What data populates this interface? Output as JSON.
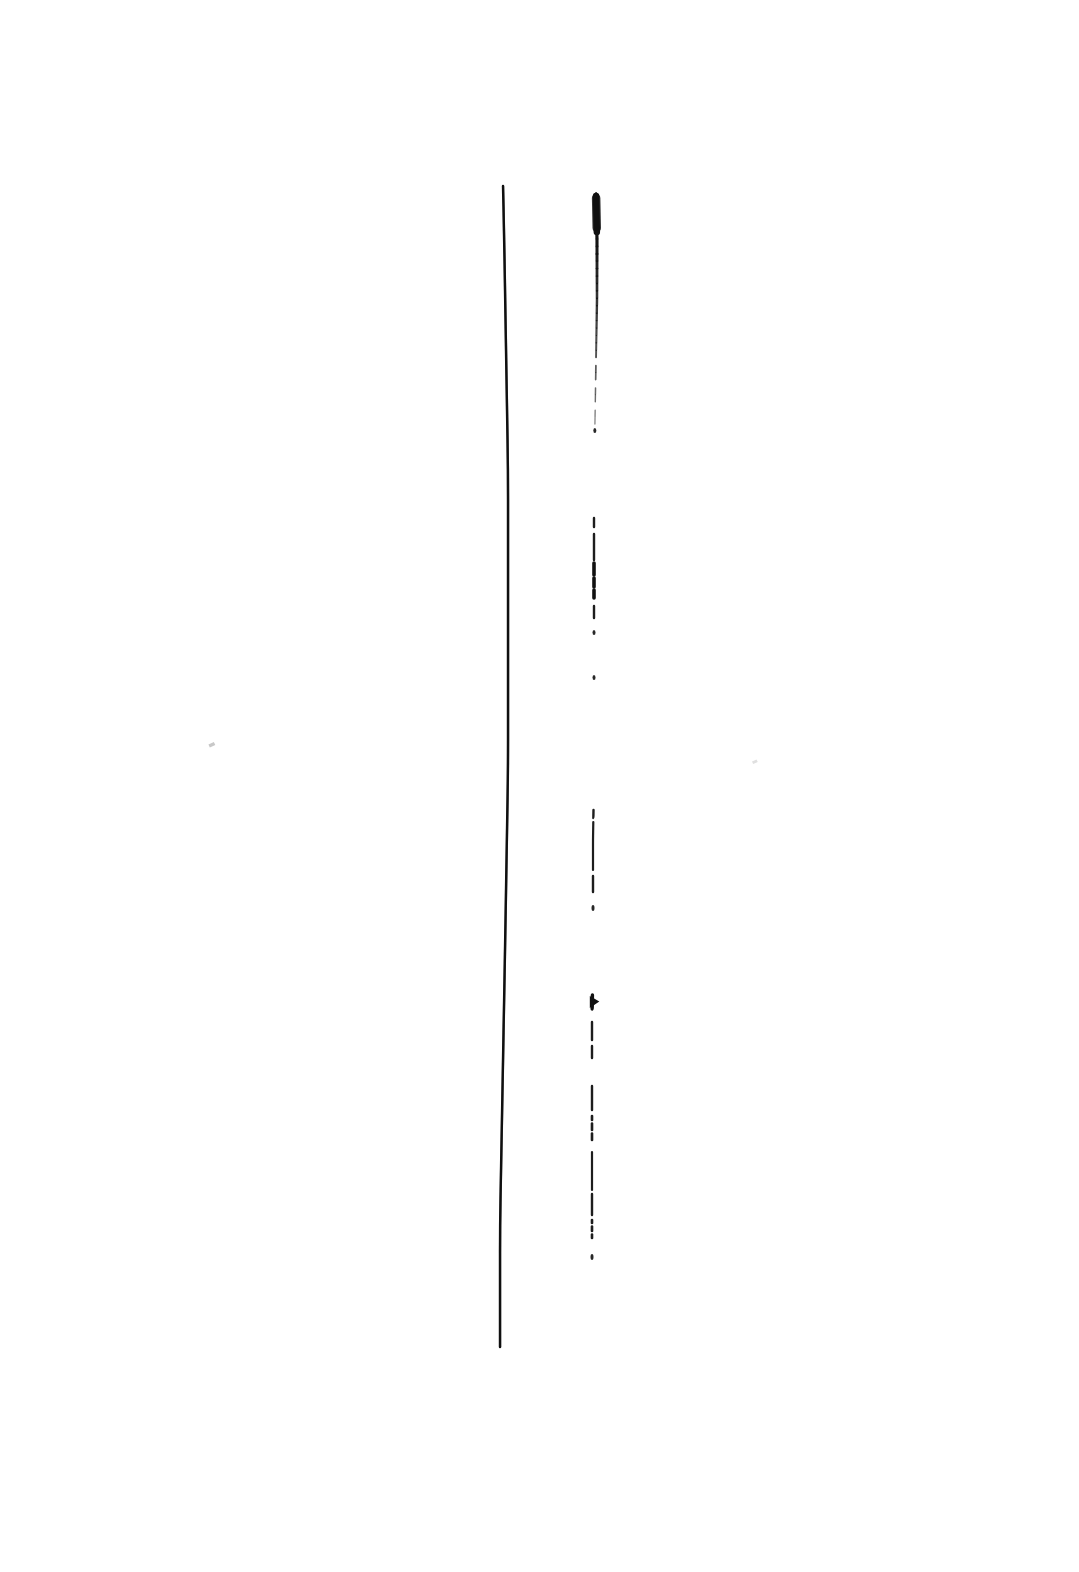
{
  "document": {
    "kind": "scanned-ink-drawing",
    "page_width": 1079,
    "page_height": 1572,
    "background_color": "#ffffff",
    "ink_color": "#111111",
    "title": "",
    "visible_text": "",
    "description": "Two near-vertical hand drawn ink strokes on a blank white page."
  },
  "chart_data": {
    "type": "line",
    "title": "",
    "xlabel": "",
    "ylabel": "",
    "grid": false,
    "legend": "none",
    "xlim": [
      0,
      1079
    ],
    "ylim": [
      0,
      1572
    ],
    "series": [
      {
        "name": "left-continuous-stroke",
        "style": "solid",
        "color": "#111111",
        "width": 2.4,
        "points": [
          [
            503,
            186
          ],
          [
            504,
            230
          ],
          [
            505,
            290
          ],
          [
            506,
            350
          ],
          [
            507,
            410
          ],
          [
            508,
            470
          ],
          [
            508,
            530
          ],
          [
            508,
            590
          ],
          [
            508,
            650
          ],
          [
            508,
            710
          ],
          [
            508,
            770
          ],
          [
            507,
            830
          ],
          [
            506,
            890
          ],
          [
            505,
            950
          ],
          [
            504,
            1005
          ],
          [
            503,
            1060
          ],
          [
            502,
            1115
          ],
          [
            501,
            1170
          ],
          [
            500,
            1225
          ],
          [
            500,
            1280
          ],
          [
            500,
            1347
          ]
        ]
      },
      {
        "name": "right-broken-stroke",
        "style": "dashed",
        "color": "#111111",
        "width": 2.2,
        "points": [
          [
            596,
            192
          ],
          [
            597,
            240
          ],
          [
            597,
            300
          ],
          [
            596,
            360
          ],
          [
            595,
            420
          ],
          [
            594,
            480
          ],
          [
            594,
            540
          ],
          [
            594,
            600
          ],
          [
            594,
            660
          ],
          [
            594,
            720
          ],
          [
            594,
            780
          ],
          [
            593,
            840
          ],
          [
            593,
            900
          ],
          [
            593,
            960
          ],
          [
            592,
            1020
          ],
          [
            592,
            1080
          ],
          [
            592,
            1140
          ],
          [
            592,
            1200
          ],
          [
            592,
            1258
          ]
        ]
      }
    ],
    "segments": [
      {
        "series": "right-broken-stroke",
        "y_start": 192,
        "y_end": 200,
        "kind": "speck"
      },
      {
        "series": "right-broken-stroke",
        "y_start": 196,
        "y_end": 232,
        "kind": "thick-blob"
      },
      {
        "series": "right-broken-stroke",
        "y_start": 232,
        "y_end": 425,
        "kind": "solid-thin"
      },
      {
        "series": "right-broken-stroke",
        "y_start": 428,
        "y_end": 433,
        "kind": "dot"
      },
      {
        "series": "right-broken-stroke",
        "y_start": 518,
        "y_end": 527,
        "kind": "dash"
      },
      {
        "series": "right-broken-stroke",
        "y_start": 534,
        "y_end": 560,
        "kind": "dash"
      },
      {
        "series": "right-broken-stroke",
        "y_start": 563,
        "y_end": 598,
        "kind": "dash-heavy"
      },
      {
        "series": "right-broken-stroke",
        "y_start": 606,
        "y_end": 618,
        "kind": "dash"
      },
      {
        "series": "right-broken-stroke",
        "y_start": 630,
        "y_end": 635,
        "kind": "dot"
      },
      {
        "series": "right-broken-stroke",
        "y_start": 675,
        "y_end": 680,
        "kind": "dot"
      },
      {
        "series": "right-broken-stroke",
        "y_start": 810,
        "y_end": 818,
        "kind": "dash"
      },
      {
        "series": "right-broken-stroke",
        "y_start": 822,
        "y_end": 870,
        "kind": "dash-long"
      },
      {
        "series": "right-broken-stroke",
        "y_start": 876,
        "y_end": 892,
        "kind": "dash"
      },
      {
        "series": "right-broken-stroke",
        "y_start": 905,
        "y_end": 911,
        "kind": "dot"
      },
      {
        "series": "right-broken-stroke",
        "y_start": 996,
        "y_end": 1008,
        "kind": "arrowhead"
      },
      {
        "series": "right-broken-stroke",
        "y_start": 1022,
        "y_end": 1040,
        "kind": "dash"
      },
      {
        "series": "right-broken-stroke",
        "y_start": 1046,
        "y_end": 1058,
        "kind": "dash"
      },
      {
        "series": "right-broken-stroke",
        "y_start": 1086,
        "y_end": 1110,
        "kind": "dash"
      },
      {
        "series": "right-broken-stroke",
        "y_start": 1116,
        "y_end": 1140,
        "kind": "dash-dotted"
      },
      {
        "series": "right-broken-stroke",
        "y_start": 1152,
        "y_end": 1190,
        "kind": "dash-long"
      },
      {
        "series": "right-broken-stroke",
        "y_start": 1194,
        "y_end": 1215,
        "kind": "dash"
      },
      {
        "series": "right-broken-stroke",
        "y_start": 1220,
        "y_end": 1238,
        "kind": "dash-dotted"
      },
      {
        "series": "right-broken-stroke",
        "y_start": 1254,
        "y_end": 1260,
        "kind": "dot"
      }
    ],
    "marks": [
      {
        "name": "faint-speck-left",
        "x": 212,
        "y": 745,
        "color": "#c8c8c8",
        "size": 6
      },
      {
        "name": "faint-speck-right",
        "x": 755,
        "y": 762,
        "color": "#e0e0e0",
        "size": 5
      }
    ]
  }
}
